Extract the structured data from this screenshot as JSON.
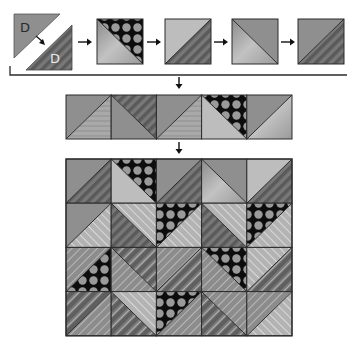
{
  "diagram": {
    "colors": {
      "background": "#ffffff",
      "line": "#2b2b2b",
      "gray": "#8f8f8f",
      "gray_dark": "#6f6f6f",
      "light": "#bdbdbd",
      "lighter": "#cfcfcf",
      "dots_bg": "#0d0d0d",
      "dot": "#9a9a9a",
      "stripe_a": "#5e5e5e",
      "stripe_b": "#7d7d7d",
      "stitch": "#e6e6e6"
    },
    "step1": {
      "triangle_top": {
        "label": "D",
        "fill": "gray"
      },
      "triangle_bottom": {
        "label": "D",
        "fill": "stripes"
      }
    },
    "sequence_squares": [
      {
        "x": 97,
        "diag": "\\",
        "a": "dots",
        "b": "grad"
      },
      {
        "x": 165,
        "diag": "/",
        "a": "light",
        "b": "stripes"
      },
      {
        "x": 232,
        "diag": "\\",
        "a": "gray",
        "b": "grad"
      },
      {
        "x": 298,
        "diag": "/",
        "a": "gray",
        "b": "stripes"
      }
    ],
    "arrows": [
      {
        "x1": 78,
        "y1": 42,
        "x2": 92,
        "y2": 42,
        "dir": "right"
      },
      {
        "x1": 147,
        "y1": 42,
        "x2": 161,
        "y2": 42,
        "dir": "right"
      },
      {
        "x1": 214,
        "y1": 42,
        "x2": 228,
        "y2": 42,
        "dir": "right"
      },
      {
        "x1": 281,
        "y1": 42,
        "x2": 295,
        "y2": 42,
        "dir": "right"
      },
      {
        "x1": 179,
        "y1": 77,
        "x2": 179,
        "y2": 89,
        "dir": "down"
      },
      {
        "x1": 179,
        "y1": 142,
        "x2": 179,
        "y2": 154,
        "dir": "down"
      }
    ],
    "strip": {
      "x": 66,
      "y": 95,
      "cell": 45.2,
      "h": 44,
      "cells": [
        {
          "diag": "/",
          "a": "gray",
          "b": "lstripes"
        },
        {
          "diag": "\\",
          "a": "stripes",
          "b": "gray"
        },
        {
          "diag": "/",
          "a": "gray",
          "b": "lstripes"
        },
        {
          "diag": "\\",
          "a": "dots",
          "b": "light"
        },
        {
          "diag": "/",
          "a": "gray",
          "b": "grad"
        }
      ]
    },
    "quilt": {
      "x": 66,
      "y": 159,
      "cell": 45.2,
      "h": 44.2,
      "rows": [
        [
          {
            "diag": "/",
            "a": "gray",
            "b": "stripes"
          },
          {
            "diag": "\\",
            "a": "dots",
            "b": "light"
          },
          {
            "diag": "/",
            "a": "gray",
            "b": "stripes"
          },
          {
            "diag": "\\",
            "a": "gray",
            "b": "grad"
          },
          {
            "diag": "/",
            "a": "light",
            "b": "stripes"
          }
        ],
        [
          {
            "diag": "/",
            "a": "gray",
            "b": "qlight"
          },
          {
            "diag": "\\",
            "a": "qlight",
            "b": "stripes"
          },
          {
            "diag": "/",
            "a": "dots",
            "b": "qlight"
          },
          {
            "diag": "\\",
            "a": "qlight",
            "b": "stripes"
          },
          {
            "diag": "/",
            "a": "dots",
            "b": "qlight"
          }
        ],
        [
          {
            "diag": "/",
            "a": "qgray",
            "b": "dots"
          },
          {
            "diag": "\\",
            "a": "qstripes",
            "b": "qgray"
          },
          {
            "diag": "/",
            "a": "qgray",
            "b": "qstripes"
          },
          {
            "diag": "\\",
            "a": "dots",
            "b": "qgray"
          },
          {
            "diag": "/",
            "a": "qlight",
            "b": "qstripes"
          }
        ],
        [
          {
            "diag": "/",
            "a": "qstripes",
            "b": "qgray"
          },
          {
            "diag": "\\",
            "a": "qlight",
            "b": "qstripes"
          },
          {
            "diag": "/",
            "a": "dots",
            "b": "qgray"
          },
          {
            "diag": "\\",
            "a": "qgray",
            "b": "qstripes"
          },
          {
            "diag": "/",
            "a": "qgray",
            "b": "qlight"
          }
        ]
      ]
    }
  }
}
